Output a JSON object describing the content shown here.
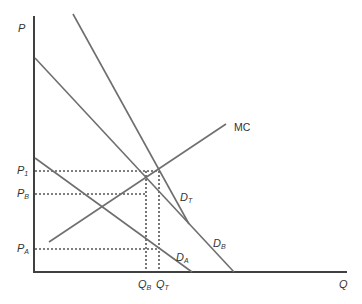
{
  "diagram": {
    "axes": {
      "y_label": "P",
      "x_label": "Q"
    },
    "curves": {
      "mc": {
        "label": "MC"
      },
      "demand_total": {
        "label": "D",
        "sub": "T"
      },
      "demand_b": {
        "label": "D",
        "sub": "B"
      },
      "demand_a": {
        "label": "D",
        "sub": "A"
      }
    },
    "price_levels": [
      {
        "label": "P",
        "sub": "1"
      },
      {
        "label": "P",
        "sub": "B"
      },
      {
        "label": "P",
        "sub": "A"
      }
    ],
    "quantity_levels": [
      {
        "label": "Q",
        "sub": "B"
      },
      {
        "label": "Q",
        "sub": "T"
      }
    ],
    "colors": {
      "axis": "#404040",
      "curve": "#6e6e6e",
      "guide": "#555555",
      "text": "#333333"
    }
  }
}
